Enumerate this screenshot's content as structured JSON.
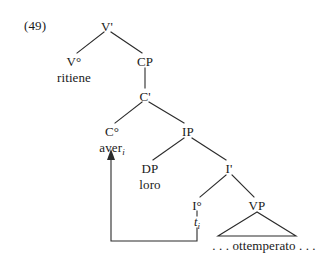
{
  "figure": {
    "number_label": "(49)",
    "language": "Italian",
    "caption_text": ""
  },
  "tree": {
    "nodes": [
      {
        "id": "Vbar",
        "label": "V'",
        "x": 107,
        "y": 26,
        "kind": "category"
      },
      {
        "id": "Vzero",
        "label": "V°",
        "x": 74,
        "y": 61,
        "kind": "category"
      },
      {
        "id": "CP",
        "label": "CP",
        "x": 145,
        "y": 61,
        "kind": "category"
      },
      {
        "id": "Cbar",
        "label": "C'",
        "x": 145,
        "y": 96,
        "kind": "category"
      },
      {
        "id": "Czero",
        "label": "C°",
        "x": 112,
        "y": 131,
        "kind": "category"
      },
      {
        "id": "IP",
        "label": "IP",
        "x": 188,
        "y": 131,
        "kind": "category"
      },
      {
        "id": "DP",
        "label": "DP",
        "x": 150,
        "y": 168,
        "kind": "category"
      },
      {
        "id": "Ibar",
        "label": "I'",
        "x": 229,
        "y": 168,
        "kind": "category"
      },
      {
        "id": "Izero",
        "label": "I°",
        "x": 197,
        "y": 205,
        "kind": "category"
      },
      {
        "id": "VP",
        "label": "VP",
        "x": 257,
        "y": 205,
        "kind": "category"
      }
    ],
    "terminals": [
      {
        "id": "ritiene",
        "text": "ritiene",
        "x": 74,
        "y": 77,
        "style": "plain"
      },
      {
        "id": "aver",
        "text": "aver",
        "subscript": "i",
        "x": 112,
        "y": 147,
        "style": "plain-sub"
      },
      {
        "id": "loro",
        "text": "loro",
        "x": 150,
        "y": 184,
        "style": "plain"
      },
      {
        "id": "trace_i",
        "text": "t",
        "subscript": "i",
        "x": 197,
        "y": 222,
        "style": "italic-sub"
      },
      {
        "id": "ottemperato",
        "text": ". . . ottemperato . . .",
        "x": 264,
        "y": 245,
        "style": "plain"
      }
    ],
    "edges": [
      {
        "from": "Vbar",
        "to": "Vzero",
        "type": "branch"
      },
      {
        "from": "Vbar",
        "to": "CP",
        "type": "branch"
      },
      {
        "from": "CP",
        "to": "Cbar",
        "type": "stem"
      },
      {
        "from": "Cbar",
        "to": "Czero",
        "type": "branch"
      },
      {
        "from": "Cbar",
        "to": "IP",
        "type": "branch"
      },
      {
        "from": "IP",
        "to": "DP",
        "type": "branch"
      },
      {
        "from": "IP",
        "to": "Ibar",
        "type": "branch"
      },
      {
        "from": "Ibar",
        "to": "Izero",
        "type": "branch"
      },
      {
        "from": "Ibar",
        "to": "VP",
        "type": "branch"
      },
      {
        "from": "Izero",
        "to": "trace_i",
        "type": "stem"
      }
    ],
    "triangle": {
      "node": "VP",
      "apex_x": 257,
      "apex_y": 212,
      "left_x": 218,
      "right_x": 296,
      "base_y": 236
    },
    "movement_arrow": {
      "from_label": "t_i",
      "to_label": "aver_i",
      "start_x": 197,
      "start_y": 228,
      "corner1_x": 197,
      "corner1_y": 241,
      "corner2_x": 111,
      "corner2_y": 241,
      "end_x": 111,
      "end_y": 155,
      "arrowhead": "up"
    }
  },
  "colors": {
    "ink": "#1a1a1a",
    "line": "#2b2b2b",
    "background": "#ffffff"
  }
}
